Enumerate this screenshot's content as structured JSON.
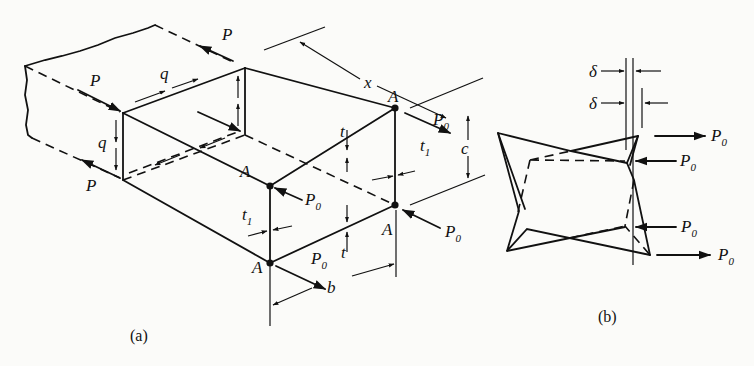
{
  "figure": {
    "panel_a": {
      "caption": "(a)",
      "labels": {
        "force_p": "P",
        "shear_flow": "q",
        "length": "x",
        "point": "A",
        "end_load": "P",
        "end_load_sub": "0",
        "thickness_wall": "t",
        "thickness_flange": "t",
        "thickness_flange_sub": "1",
        "width": "b",
        "height": "c"
      }
    },
    "panel_b": {
      "caption": "(b)",
      "labels": {
        "warping": "δ",
        "end_load": "P",
        "end_load_sub": "0"
      }
    }
  }
}
